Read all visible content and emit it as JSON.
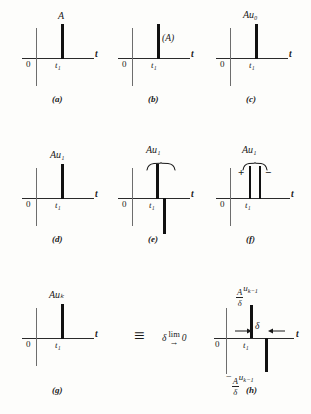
{
  "figure": {
    "type": "diagram",
    "axis": {
      "t_label": "t",
      "origin_label": "0",
      "tick_label": "t₁"
    }
  },
  "panels": [
    {
      "tag": "(a)",
      "amplitude_label": "A",
      "amplitude_placement": "above-impulse",
      "tick_label": "t₁",
      "origin_label": "0",
      "t_label": "t",
      "impulses": [
        {
          "direction": "up",
          "height": 38
        }
      ]
    },
    {
      "tag": "(b)",
      "amplitude_label": "(A)",
      "amplitude_placement": "right-of-impulse",
      "tick_label": "t₁",
      "origin_label": "0",
      "t_label": "t",
      "impulses": [
        {
          "direction": "up",
          "height": 38
        }
      ]
    },
    {
      "tag": "(c)",
      "amplitude_label": "Au₀",
      "amplitude_placement": "above-impulse",
      "tick_label": "t₁",
      "origin_label": "0",
      "t_label": "t",
      "impulses": [
        {
          "direction": "up",
          "height": 38
        }
      ]
    },
    {
      "tag": "(d)",
      "amplitude_label": "Au₁",
      "amplitude_placement": "above-impulse",
      "tick_label": "t₁",
      "origin_label": "0",
      "t_label": "t",
      "impulses": [
        {
          "direction": "up",
          "height": 38
        }
      ]
    },
    {
      "tag": "(e)",
      "amplitude_label": "Au₁",
      "amplitude_placement": "above-brace",
      "has_brace": true,
      "tick_label": "t₁",
      "origin_label": "0",
      "t_label": "t",
      "impulses": [
        {
          "direction": "up",
          "height": 36
        },
        {
          "direction": "down",
          "height": 36
        }
      ]
    },
    {
      "tag": "(f)",
      "amplitude_label": "Au₁",
      "amplitude_placement": "above-brace",
      "has_brace": true,
      "plus_label": "+",
      "minus_label": "−",
      "tick_label": "t₁",
      "origin_label": "0",
      "t_label": "t",
      "impulses": [
        {
          "direction": "up",
          "height": 34
        },
        {
          "direction": "up",
          "height": 34
        }
      ]
    },
    {
      "tag": "(g)",
      "amplitude_label": "Auₖ",
      "amplitude_placement": "above-impulse",
      "tick_label": "t₁",
      "origin_label": "0",
      "t_label": "t",
      "impulses": [
        {
          "direction": "up",
          "height": 38
        }
      ]
    },
    {
      "tag": "(h)",
      "top_label_numerator": "A",
      "top_label_denominator": "δ",
      "top_label_suffix": "u",
      "top_label_subscript": "k−1",
      "bottom_label_sign": "−",
      "bottom_label_numerator": "A",
      "bottom_label_denominator": "δ",
      "bottom_label_suffix": "u",
      "bottom_label_subscript": "k−1",
      "width_label": "δ",
      "tick_label": "t₁",
      "origin_label": "0",
      "t_label": "t",
      "impulses": [
        {
          "direction": "up",
          "height": 34
        },
        {
          "direction": "down",
          "height": 34
        }
      ]
    }
  ],
  "equivalence": {
    "identity_symbol": "≡",
    "limit_word": "lim",
    "limit_variable": "δ",
    "limit_arrow": "→",
    "limit_target": "0"
  },
  "colors": {
    "ink": "#111111",
    "axis": "#2a2a2a",
    "vertical_axis": "#6d6d6d",
    "background": "#fdfdfb"
  }
}
